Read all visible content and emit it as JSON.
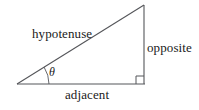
{
  "diagram": {
    "background_color": "#ffffff",
    "stroke_color": "#55565a",
    "text_color": "#1a1a1a",
    "labels": {
      "hypotenuse": "hypotenuse",
      "opposite": "opposite",
      "adjacent": "adjacent",
      "angle": "θ"
    },
    "geometry": {
      "left_vertex": [
        17,
        84
      ],
      "apex_vertex": [
        144,
        5
      ],
      "right_angle_vertex": [
        144,
        84
      ],
      "right_angle_marker": {
        "x": 136,
        "y": 76,
        "size": 8
      },
      "angle_arc": {
        "center": [
          17,
          84
        ],
        "radius": 32,
        "start_deg": 0,
        "end_deg": 32
      }
    }
  }
}
